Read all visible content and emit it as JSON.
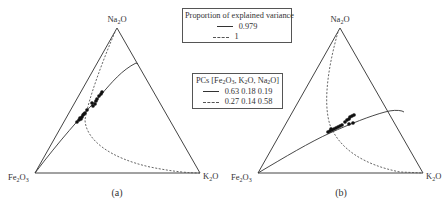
{
  "figure": {
    "panels": [
      {
        "caption": "(a)",
        "vertices": {
          "top": "Na2O",
          "left": "Fe2O3",
          "right": "K2O"
        }
      },
      {
        "caption": "(b)",
        "vertices": {
          "top": "Na2O",
          "left": "Fe2O3",
          "right": "K2O"
        }
      }
    ],
    "legend_variance": {
      "title": "Proportion of explained variance",
      "entries": [
        {
          "style": "solid",
          "label": "0.979"
        },
        {
          "style": "dashed",
          "label": "1"
        }
      ]
    },
    "legend_pcs": {
      "title_prefix": "PCs [Fe",
      "entries": [
        {
          "style": "solid",
          "label": "0.63 0.18 0.19"
        },
        {
          "style": "dashed",
          "label": "0.27 0.14 0.58"
        }
      ]
    },
    "colors": {
      "line": "#333333",
      "points": "#111111",
      "background": "#ffffff"
    }
  }
}
